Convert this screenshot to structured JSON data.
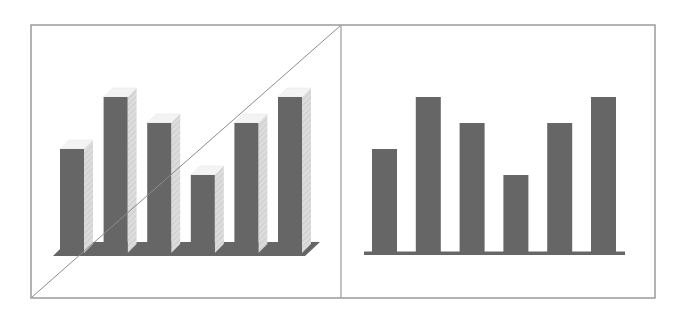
{
  "figure": {
    "frame_color": "#9a9a9a",
    "bar_color": "#666666",
    "side_color": "#d9d9d9",
    "top_color": "#f3f3f3",
    "strike_color": "#8c8c8c"
  },
  "chart_data": [
    {
      "type": "bar",
      "variant": "3d",
      "title": "",
      "xlabel": "",
      "ylabel": "",
      "categories": [
        "1",
        "2",
        "3",
        "4",
        "5",
        "6"
      ],
      "values": [
        4,
        6,
        5,
        3,
        5,
        6
      ],
      "ylim": [
        0,
        7
      ],
      "grid": false,
      "legend": null,
      "annotations": [
        "diagonal strike-through line from bottom-left to top-right of panel"
      ]
    },
    {
      "type": "bar",
      "variant": "2d",
      "title": "",
      "xlabel": "",
      "ylabel": "",
      "categories": [
        "1",
        "2",
        "3",
        "4",
        "5",
        "6"
      ],
      "values": [
        4,
        6,
        5,
        3,
        5,
        6
      ],
      "ylim": [
        0,
        7
      ],
      "grid": false,
      "legend": null
    }
  ]
}
